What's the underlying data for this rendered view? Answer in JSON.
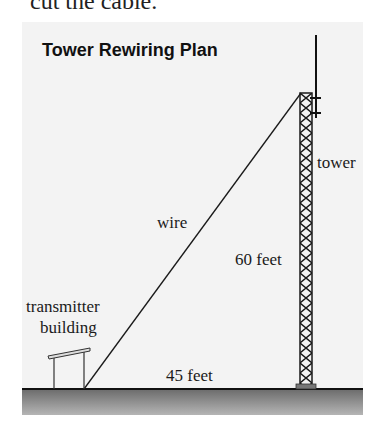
{
  "top_text": "cut the cable.",
  "diagram": {
    "title": "Tower Rewiring Plan",
    "labels": {
      "tower": "tower",
      "wire": "wire",
      "height": "60 feet",
      "distance": "45 feet",
      "building_line1": "transmitter",
      "building_line2": "building"
    },
    "measurements": {
      "tower_height_ft": 60,
      "ground_distance_ft": 45
    },
    "colors": {
      "background": "#f3f3f3",
      "line": "#1a1a1a",
      "ground_top": "#6b6b6b",
      "ground_bottom": "#b5b5b5"
    }
  }
}
